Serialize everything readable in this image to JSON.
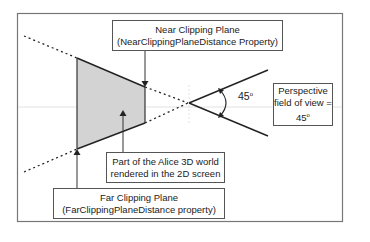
{
  "diagram": {
    "near_plane": {
      "line1": "Near Clipping Plane",
      "line2": "(NearClippingPlaneDistance Property)"
    },
    "far_plane": {
      "line1": "Far Clipping Plane",
      "line2": "(FarClippingPlaneDistance property)"
    },
    "rendered_region": {
      "line1": "Part of the Alice 3D world",
      "line2": "rendered in the 2D screen"
    },
    "fov_box": {
      "line1": "Perspective",
      "line2": "field of view =",
      "line3_value": "45",
      "line3_unit": "o"
    },
    "angle_label": {
      "value": "45",
      "unit": "o"
    },
    "colors": {
      "frame": "#777777",
      "frustum_fill": "#d3d3d3",
      "lines": "#222222",
      "guide": "#dddddd"
    }
  }
}
